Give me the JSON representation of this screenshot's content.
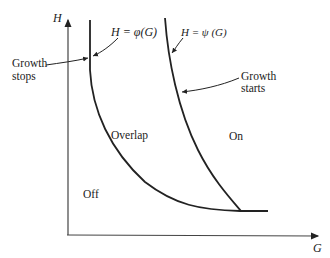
{
  "diagram": {
    "axes": {
      "y_label": "H",
      "x_label": "G"
    },
    "curves": [
      {
        "label": "H = φ(G)",
        "description": "lower threshold curve"
      },
      {
        "label": "H = ψ (G)",
        "description": "upper threshold curve"
      }
    ],
    "annotations": {
      "growth_stops_line1": "Growth",
      "growth_stops_line2": "stops",
      "growth_starts_line1": "Growth",
      "growth_starts_line2": "starts"
    },
    "regions": {
      "overlap": "Overlap",
      "on": "On",
      "off": "Off"
    },
    "colors": {
      "line": "#222222",
      "background": "#ffffff"
    }
  }
}
